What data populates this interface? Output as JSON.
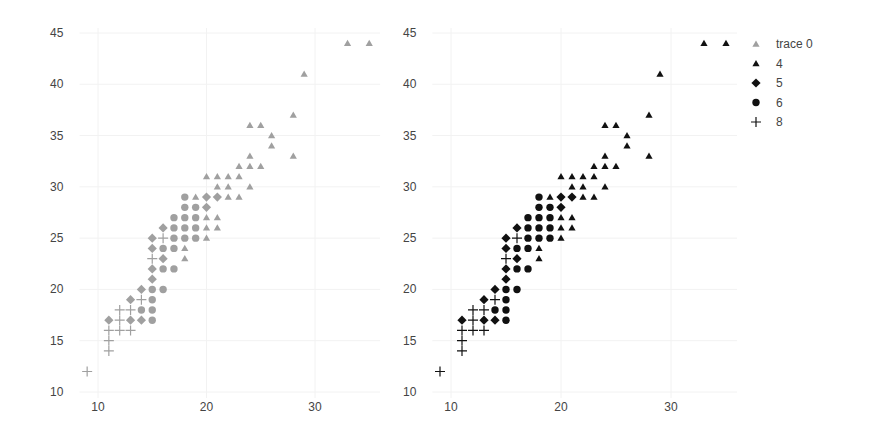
{
  "chart_data": [
    {
      "type": "scatter",
      "panel": "left",
      "title": "",
      "xlabel": "",
      "ylabel": "",
      "xlim": [
        8.3,
        36
      ],
      "ylim": [
        10,
        45
      ],
      "xticks": [
        10,
        20,
        30
      ],
      "yticks": [
        10,
        15,
        20,
        25,
        30,
        35,
        40,
        45
      ],
      "grid": true,
      "color": "#a0a0a0",
      "series": [
        {
          "name": "4",
          "marker": "triangle",
          "points": [
            [
              33,
              44
            ],
            [
              35,
              44
            ],
            [
              29,
              41
            ],
            [
              28,
              37
            ],
            [
              28,
              33
            ],
            [
              24,
              36
            ],
            [
              25,
              36
            ],
            [
              26,
              35
            ],
            [
              26,
              34
            ],
            [
              24,
              33
            ],
            [
              23,
              32
            ],
            [
              24,
              32
            ],
            [
              25,
              32
            ],
            [
              20,
              31
            ],
            [
              21,
              31
            ],
            [
              22,
              31
            ],
            [
              23,
              31
            ],
            [
              21,
              30
            ],
            [
              22,
              30
            ],
            [
              24,
              30
            ],
            [
              19,
              29
            ],
            [
              22,
              29
            ],
            [
              23,
              29
            ],
            [
              20,
              27
            ],
            [
              21,
              27
            ],
            [
              20,
              26
            ],
            [
              21,
              26
            ],
            [
              20,
              25
            ],
            [
              18,
              24
            ],
            [
              18,
              23
            ]
          ]
        },
        {
          "name": "5",
          "marker": "diamond",
          "points": [
            [
              20,
              29
            ],
            [
              21,
              29
            ],
            [
              20,
              28
            ],
            [
              16,
              26
            ],
            [
              15,
              25
            ],
            [
              15,
              24
            ],
            [
              16,
              23
            ],
            [
              15,
              22
            ],
            [
              15,
              21
            ],
            [
              14,
              20
            ],
            [
              13,
              19
            ],
            [
              11,
              17
            ],
            [
              13,
              17
            ],
            [
              14,
              17
            ]
          ]
        },
        {
          "name": "6",
          "marker": "circle",
          "points": [
            [
              18,
              29
            ],
            [
              18,
              28
            ],
            [
              19,
              28
            ],
            [
              17,
              27
            ],
            [
              18,
              27
            ],
            [
              19,
              27
            ],
            [
              17,
              26
            ],
            [
              18,
              26
            ],
            [
              19,
              26
            ],
            [
              17,
              25
            ],
            [
              18,
              25
            ],
            [
              19,
              25
            ],
            [
              16,
              24
            ],
            [
              17,
              24
            ],
            [
              16,
              22
            ],
            [
              17,
              22
            ],
            [
              15,
              20
            ],
            [
              16,
              20
            ],
            [
              15,
              19
            ],
            [
              14,
              18
            ],
            [
              15,
              18
            ],
            [
              15,
              17
            ]
          ]
        },
        {
          "name": "8",
          "marker": "plus",
          "points": [
            [
              16,
              25
            ],
            [
              15,
              23
            ],
            [
              14,
              19
            ],
            [
              12,
              18
            ],
            [
              13,
              18
            ],
            [
              12,
              17
            ],
            [
              11,
              16
            ],
            [
              12,
              16
            ],
            [
              13,
              16
            ],
            [
              11,
              15
            ],
            [
              11,
              14
            ],
            [
              9,
              12
            ]
          ]
        }
      ]
    },
    {
      "type": "scatter",
      "panel": "right",
      "title": "",
      "xlabel": "",
      "ylabel": "",
      "xlim": [
        8.3,
        36
      ],
      "ylim": [
        10,
        45
      ],
      "xticks": [
        10,
        20,
        30
      ],
      "yticks": [
        10,
        15,
        20,
        25,
        30,
        35,
        40,
        45
      ],
      "grid": true,
      "color": "#111111",
      "legend": {
        "position": "right",
        "entries": [
          "trace 0",
          "4",
          "5",
          "6",
          "8"
        ]
      },
      "series": [
        {
          "name": "4",
          "marker": "triangle",
          "points": [
            [
              33,
              44
            ],
            [
              35,
              44
            ],
            [
              29,
              41
            ],
            [
              28,
              37
            ],
            [
              28,
              33
            ],
            [
              24,
              36
            ],
            [
              25,
              36
            ],
            [
              26,
              35
            ],
            [
              26,
              34
            ],
            [
              24,
              33
            ],
            [
              23,
              32
            ],
            [
              24,
              32
            ],
            [
              25,
              32
            ],
            [
              20,
              31
            ],
            [
              21,
              31
            ],
            [
              22,
              31
            ],
            [
              23,
              31
            ],
            [
              21,
              30
            ],
            [
              22,
              30
            ],
            [
              24,
              30
            ],
            [
              19,
              29
            ],
            [
              22,
              29
            ],
            [
              23,
              29
            ],
            [
              20,
              27
            ],
            [
              21,
              27
            ],
            [
              20,
              26
            ],
            [
              21,
              26
            ],
            [
              20,
              25
            ],
            [
              18,
              24
            ],
            [
              18,
              23
            ]
          ]
        },
        {
          "name": "5",
          "marker": "diamond",
          "points": [
            [
              20,
              29
            ],
            [
              21,
              29
            ],
            [
              20,
              28
            ],
            [
              16,
              26
            ],
            [
              15,
              25
            ],
            [
              15,
              24
            ],
            [
              16,
              23
            ],
            [
              15,
              22
            ],
            [
              15,
              21
            ],
            [
              14,
              20
            ],
            [
              13,
              19
            ],
            [
              11,
              17
            ],
            [
              13,
              17
            ],
            [
              14,
              17
            ]
          ]
        },
        {
          "name": "6",
          "marker": "circle",
          "points": [
            [
              18,
              29
            ],
            [
              18,
              28
            ],
            [
              19,
              28
            ],
            [
              17,
              27
            ],
            [
              18,
              27
            ],
            [
              19,
              27
            ],
            [
              17,
              26
            ],
            [
              18,
              26
            ],
            [
              19,
              26
            ],
            [
              17,
              25
            ],
            [
              18,
              25
            ],
            [
              19,
              25
            ],
            [
              16,
              24
            ],
            [
              17,
              24
            ],
            [
              16,
              22
            ],
            [
              17,
              22
            ],
            [
              15,
              20
            ],
            [
              16,
              20
            ],
            [
              15,
              19
            ],
            [
              14,
              18
            ],
            [
              15,
              18
            ],
            [
              15,
              17
            ]
          ]
        },
        {
          "name": "8",
          "marker": "plus",
          "points": [
            [
              16,
              25
            ],
            [
              15,
              23
            ],
            [
              14,
              19
            ],
            [
              12,
              18
            ],
            [
              13,
              18
            ],
            [
              12,
              17
            ],
            [
              11,
              16
            ],
            [
              12,
              16
            ],
            [
              13,
              16
            ],
            [
              11,
              15
            ],
            [
              11,
              14
            ],
            [
              9,
              12
            ]
          ]
        }
      ]
    }
  ],
  "legend": {
    "entries": [
      {
        "label": "trace 0",
        "marker": "triangle",
        "color": "#a0a0a0"
      },
      {
        "label": "4",
        "marker": "triangle",
        "color": "#111111"
      },
      {
        "label": "5",
        "marker": "diamond",
        "color": "#111111"
      },
      {
        "label": "6",
        "marker": "circle",
        "color": "#111111"
      },
      {
        "label": "8",
        "marker": "plus",
        "color": "#111111"
      }
    ]
  },
  "layout": {
    "panels": [
      {
        "x0px": 98,
        "x1px": 315,
        "xv0": 10,
        "xv1": 30,
        "y0px": 392,
        "y1px": 33,
        "yv0": 10,
        "yv1": 45,
        "tickLabelX": 50,
        "xTickLabelY": 411
      },
      {
        "x0px": 451,
        "x1px": 671,
        "xv0": 10,
        "xv1": 30,
        "y0px": 392,
        "y1px": 33,
        "yv0": 10,
        "yv1": 45,
        "tickLabelX": 403,
        "xTickLabelY": 411
      }
    ],
    "plotTop": 28,
    "plotBottom": 398,
    "legend": {
      "x": 756,
      "y": 44,
      "dy": 19.5
    }
  }
}
